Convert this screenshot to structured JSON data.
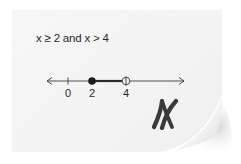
{
  "card": {
    "expression": "x ≥ 2 and x > 4",
    "result_icon": "x-mark-icon",
    "colors": {
      "paper": "#f4f4f4",
      "ink": "#2a2a2a",
      "mark": "#3a3a3a"
    }
  },
  "number_line": {
    "ticks": [
      {
        "value": 0,
        "label": "0"
      },
      {
        "value": 2,
        "label": "2"
      },
      {
        "value": 4,
        "label": "4"
      }
    ],
    "closed_point": {
      "value": 2,
      "label": "2"
    },
    "open_point": {
      "value": 4,
      "label": "4"
    },
    "shaded_segment": {
      "from": 2,
      "to": 4
    },
    "arrows": [
      "left",
      "right"
    ]
  }
}
